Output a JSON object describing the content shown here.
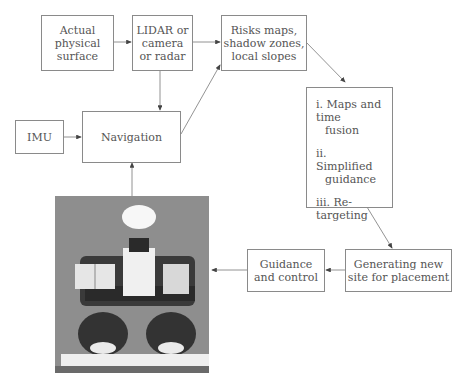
{
  "diagram": {
    "nodes": {
      "surface": {
        "lines": [
          "Actual",
          "physical",
          "surface"
        ]
      },
      "sensor": {
        "lines": [
          "LIDAR or",
          "camera",
          "or radar"
        ]
      },
      "risks": {
        "lines": [
          "Risks maps,",
          "shadow zones,",
          "local slopes"
        ]
      },
      "steps": {
        "items": [
          {
            "l1": "i. Maps and time",
            "l2": "fusion"
          },
          {
            "l1": "ii. Simplified",
            "l2": "guidance"
          },
          {
            "l1": "iii. Re-targeting",
            "l2": ""
          }
        ]
      },
      "imu": {
        "label": "IMU"
      },
      "navigation": {
        "label": "Navigation"
      },
      "guidance": {
        "lines": [
          "Guidance",
          "and control"
        ]
      },
      "generating": {
        "lines": [
          "Generating new",
          "site for placement"
        ]
      },
      "robot_photo": {
        "alt": "Rover robot photo"
      }
    },
    "edges": [
      {
        "from": "surface",
        "to": "sensor"
      },
      {
        "from": "sensor",
        "to": "risks"
      },
      {
        "from": "sensor",
        "to": "navigation"
      },
      {
        "from": "navigation",
        "to": "risks"
      },
      {
        "from": "risks",
        "to": "steps"
      },
      {
        "from": "imu",
        "to": "navigation"
      },
      {
        "from": "robot_photo",
        "to": "navigation"
      },
      {
        "from": "steps",
        "to": "generating"
      },
      {
        "from": "generating",
        "to": "guidance"
      },
      {
        "from": "guidance",
        "to": "robot_photo"
      }
    ]
  }
}
